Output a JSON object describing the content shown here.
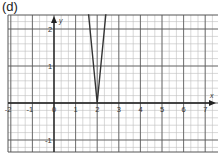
{
  "panel_label": "(d)",
  "chart_data": {
    "type": "line",
    "title": "",
    "xlabel": "x",
    "ylabel": "y",
    "xlim": [
      -2.2,
      7.5
    ],
    "ylim": [
      -1.3,
      2.4
    ],
    "grid": true,
    "x_ticks": [
      "-2",
      "-1",
      "0",
      "1",
      "2",
      "3",
      "4",
      "5",
      "6",
      "7"
    ],
    "y_ticks": [
      "2",
      "1",
      "-1"
    ],
    "origin_label": "0",
    "series": [
      {
        "name": "y = 6|x - 2|",
        "x": [
          1.6,
          2,
          2.4
        ],
        "y": [
          2.4,
          0,
          2.4
        ]
      }
    ],
    "colors": {
      "line": "#333333",
      "grid_major": "#555555",
      "grid_minor": "#bdbdbd",
      "axis": "#222222"
    }
  }
}
